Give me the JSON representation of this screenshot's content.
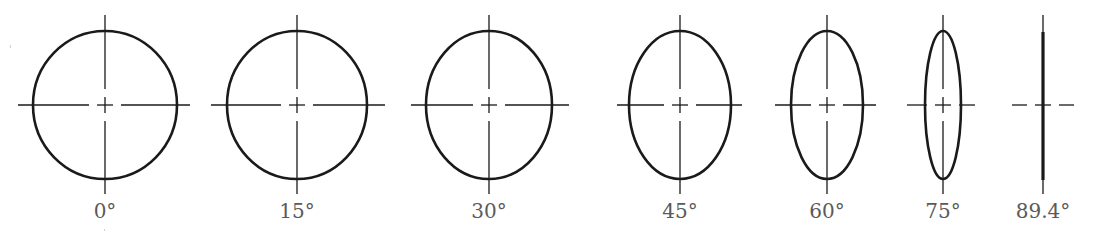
{
  "figure": {
    "stroke_color": "#1a1a1a",
    "label_color": "#5a5a5a",
    "center_y": 105,
    "semi_major_px": 74,
    "items": [
      {
        "label": "0°",
        "angle": 0,
        "cx": 105,
        "rx": 72,
        "h_line": [
          18,
          190
        ]
      },
      {
        "label": "15°",
        "angle": 15,
        "cx": 297,
        "rx": 70,
        "h_line": [
          211,
          385
        ]
      },
      {
        "label": "30°",
        "angle": 30,
        "cx": 489,
        "rx": 63,
        "h_line": [
          411,
          569
        ]
      },
      {
        "label": "45°",
        "angle": 45,
        "cx": 680,
        "rx": 51,
        "h_line": [
          617,
          742
        ]
      },
      {
        "label": "60°",
        "angle": 60,
        "cx": 827,
        "rx": 36,
        "h_line": [
          775,
          876
        ]
      },
      {
        "label": "75°",
        "angle": 75,
        "cx": 943,
        "rx": 18,
        "h_line": [
          907,
          975
        ]
      },
      {
        "label": "89.4°",
        "angle": 89.4,
        "cx": 1043,
        "rx": 1,
        "h_line": [
          1012,
          1074
        ]
      }
    ]
  }
}
